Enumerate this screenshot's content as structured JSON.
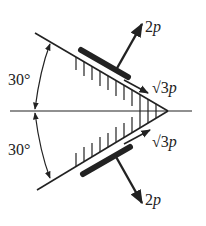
{
  "diagram": {
    "angle_top": "30°",
    "angle_bottom": "30°",
    "force_upper_normal": {
      "coef": "2",
      "var": "p"
    },
    "force_upper_shear": {
      "coef": "√3",
      "var": "p"
    },
    "force_lower_shear": {
      "coef": "√3",
      "var": "p"
    },
    "force_lower_normal": {
      "coef": "2",
      "var": "p"
    },
    "colors": {
      "line": "#222222"
    }
  }
}
